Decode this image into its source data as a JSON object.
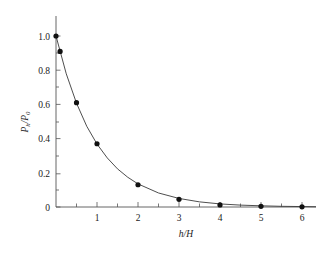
{
  "figure": {
    "background_color": "#ffffff",
    "axis_color": "#555555",
    "curve_color": "#3a3a3a",
    "marker_color": "#111111"
  },
  "axes": {
    "x_title": "h/H",
    "x_title_parts": {
      "numerator": "h",
      "slash": "/",
      "denominator": "H"
    },
    "y_title": "Ph/P0",
    "y_title_parts": {
      "p1": "P",
      "sub1": "h",
      "slash": "/",
      "p2": "P",
      "sub2": "0"
    },
    "x_tick_labels": [
      "1",
      "2",
      "3",
      "4",
      "5",
      "6"
    ],
    "y_tick_labels": [
      "0",
      "0.2",
      "0.4",
      "0.6",
      "0.8",
      "1.0"
    ]
  },
  "chart_data": {
    "type": "scatter",
    "title": "",
    "subtitle": "",
    "xlabel": "h/H",
    "ylabel": "Ph/P0",
    "xlim": [
      0,
      6.3
    ],
    "ylim": [
      0,
      1.06
    ],
    "xticks": [
      1,
      2,
      3,
      4,
      5,
      6
    ],
    "yticks": [
      0,
      0.2,
      0.4,
      0.6,
      0.8,
      1.0
    ],
    "grid": false,
    "legend": null,
    "series": [
      {
        "name": "measured points",
        "marker": "filled-circle",
        "x": [
          0.0,
          0.1,
          0.5,
          1.0,
          2.0,
          3.0,
          4.0,
          5.0,
          6.0
        ],
        "values": [
          1.0,
          0.91,
          0.61,
          0.37,
          0.13,
          0.045,
          0.012,
          0.004,
          0.001
        ]
      },
      {
        "name": "fitted exponential curve",
        "marker": "none",
        "equation": "exp(-x)",
        "x": [
          0.0,
          0.25,
          0.5,
          0.75,
          1.0,
          1.25,
          1.5,
          1.75,
          2.0,
          2.5,
          3.0,
          3.5,
          4.0,
          4.5,
          5.0,
          5.5,
          6.0
        ],
        "values": [
          1.0,
          0.779,
          0.607,
          0.472,
          0.368,
          0.287,
          0.223,
          0.174,
          0.135,
          0.082,
          0.05,
          0.03,
          0.018,
          0.011,
          0.007,
          0.004,
          0.0025
        ]
      }
    ]
  }
}
